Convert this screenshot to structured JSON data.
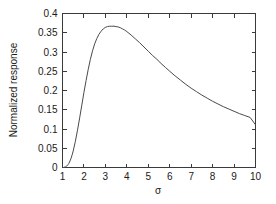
{
  "chart_data": {
    "type": "line",
    "title": "",
    "xlabel": "σ",
    "ylabel": "Normalized response",
    "xlim": [
      1,
      10
    ],
    "ylim": [
      0,
      0.4
    ],
    "grid": false,
    "legend": null,
    "xticks": [
      1,
      2,
      3,
      4,
      5,
      6,
      7,
      8,
      9,
      10
    ],
    "xtick_labels": [
      "1",
      "2",
      "3",
      "4",
      "5",
      "6",
      "7",
      "8",
      "9",
      "10"
    ],
    "yticks": [
      0,
      0.05,
      0.1,
      0.15,
      0.2,
      0.25,
      0.3,
      0.35,
      0.4
    ],
    "ytick_labels": [
      "0",
      "0.05",
      "0.1",
      "0.15",
      "0.2",
      "0.25",
      "0.3",
      "0.35",
      "0.4"
    ],
    "series": [
      {
        "name": "Normalized response",
        "color": "#4a4a4a",
        "x": [
          1.0,
          1.05,
          1.1,
          1.15,
          1.2,
          1.25,
          1.3,
          1.35,
          1.4,
          1.45,
          1.5,
          1.6,
          1.7,
          1.8,
          1.9,
          2.0,
          2.1,
          2.2,
          2.3,
          2.4,
          2.5,
          2.6,
          2.7,
          2.8,
          2.9,
          3.0,
          3.1,
          3.2,
          3.3,
          3.4,
          3.5,
          3.6,
          3.7,
          3.8,
          3.9,
          4.0,
          4.2,
          4.4,
          4.6,
          4.8,
          5.0,
          5.2,
          5.4,
          5.6,
          5.8,
          6.0,
          6.25,
          6.5,
          6.75,
          7.0,
          7.25,
          7.5,
          7.75,
          8.0,
          8.25,
          8.5,
          8.75,
          9.0,
          9.25,
          9.5,
          9.75,
          10.0
        ],
        "y": [
          0.0,
          0.0,
          0.001,
          0.002,
          0.004,
          0.007,
          0.011,
          0.017,
          0.024,
          0.033,
          0.043,
          0.068,
          0.097,
          0.129,
          0.162,
          0.195,
          0.226,
          0.255,
          0.281,
          0.303,
          0.321,
          0.335,
          0.346,
          0.354,
          0.36,
          0.364,
          0.366,
          0.367,
          0.367,
          0.367,
          0.366,
          0.365,
          0.363,
          0.36,
          0.357,
          0.353,
          0.344,
          0.334,
          0.324,
          0.313,
          0.302,
          0.291,
          0.281,
          0.27,
          0.26,
          0.25,
          0.238,
          0.227,
          0.216,
          0.206,
          0.197,
          0.188,
          0.18,
          0.172,
          0.165,
          0.158,
          0.152,
          0.146,
          0.14,
          0.135,
          0.13,
          0.111
        ]
      }
    ],
    "annotations": {
      "peak_x": 3.35,
      "peak_y": 0.367,
      "endpoint_x": 10,
      "endpoint_y": 0.111
    }
  }
}
